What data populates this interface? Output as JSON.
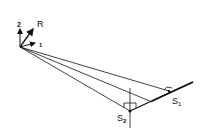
{
  "diagram": {
    "type": "geometric-line-diagram",
    "labels": {
      "axis_up": "2",
      "axis_diag": "R",
      "axis_right": "1",
      "point_s1": "S",
      "point_s1_sub": "1",
      "point_s2": "S",
      "point_s2_sub": "2"
    },
    "colors": {
      "stroke": "#111111",
      "background": "#ffffff"
    },
    "origin": [
      20,
      47
    ],
    "points": {
      "S1": [
        169,
        91
      ],
      "S2": [
        130,
        111
      ],
      "mid": [
        152,
        102
      ]
    }
  }
}
